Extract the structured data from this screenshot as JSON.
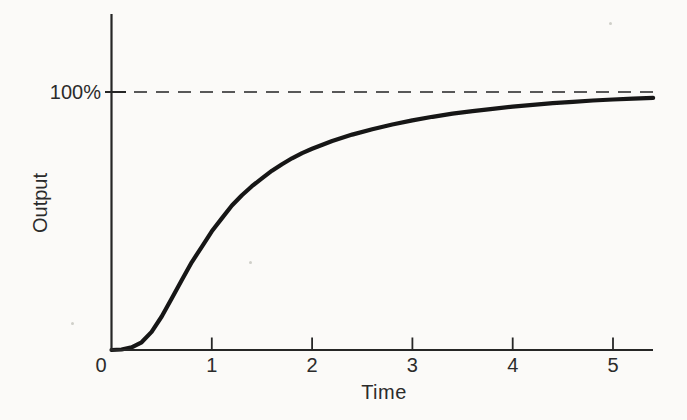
{
  "figure": {
    "background": "#fbfaf8"
  },
  "chart_data": {
    "type": "line",
    "title": "",
    "xlabel": "Time",
    "ylabel": "Output",
    "ref_label": "100%",
    "ref_value": 100,
    "x_ticks": [
      0,
      1,
      2,
      3,
      4,
      5
    ],
    "x_tick_labels": [
      "0",
      "1",
      "2",
      "3",
      "4",
      "5"
    ],
    "xlim": [
      0,
      5.4
    ],
    "ylim": [
      0,
      130
    ],
    "grid": false,
    "legend": "none",
    "line_color": "#161616",
    "axis_color": "#262626",
    "dash_color": "#585858",
    "text_color": "#2b2b2b",
    "annotations": [
      "dashed horizontal asymptote at 100% output"
    ],
    "series": [
      {
        "name": "output-step-response",
        "points": [
          [
            0,
            0
          ],
          [
            0.1,
            0.2
          ],
          [
            0.2,
            1
          ],
          [
            0.3,
            3
          ],
          [
            0.4,
            7
          ],
          [
            0.5,
            13
          ],
          [
            0.6,
            20
          ],
          [
            0.7,
            27
          ],
          [
            0.8,
            34
          ],
          [
            0.9,
            40
          ],
          [
            1.0,
            46
          ],
          [
            1.1,
            51
          ],
          [
            1.2,
            56
          ],
          [
            1.3,
            60
          ],
          [
            1.4,
            63.5
          ],
          [
            1.5,
            66.5
          ],
          [
            1.6,
            69.5
          ],
          [
            1.7,
            72
          ],
          [
            1.8,
            74.3
          ],
          [
            1.9,
            76.3
          ],
          [
            2.0,
            78
          ],
          [
            2.2,
            81
          ],
          [
            2.4,
            83.5
          ],
          [
            2.6,
            85.6
          ],
          [
            2.8,
            87.4
          ],
          [
            3.0,
            89
          ],
          [
            3.2,
            90.4
          ],
          [
            3.4,
            91.6
          ],
          [
            3.6,
            92.6
          ],
          [
            3.8,
            93.5
          ],
          [
            4.0,
            94.3
          ],
          [
            4.2,
            95.0
          ],
          [
            4.4,
            95.7
          ],
          [
            4.6,
            96.2
          ],
          [
            4.8,
            96.7
          ],
          [
            5.0,
            97.1
          ],
          [
            5.2,
            97.4
          ],
          [
            5.4,
            97.7
          ]
        ]
      }
    ]
  }
}
